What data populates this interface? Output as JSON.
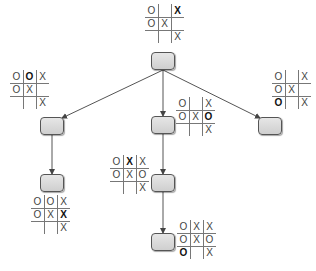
{
  "nodes": [
    {
      "id": "root",
      "x": 151,
      "y": 52,
      "board": {
        "x": 145,
        "y": 4,
        "cells": [
          [
            "O",
            "",
            "X"
          ],
          [
            "O",
            "X",
            ""
          ],
          [
            "",
            "",
            "X"
          ]
        ],
        "bold": [
          0,
          2
        ]
      }
    },
    {
      "id": "left-1",
      "x": 40,
      "y": 117,
      "board": {
        "x": 10,
        "y": 70,
        "cells": [
          [
            "O",
            "O",
            "X"
          ],
          [
            "O",
            "X",
            ""
          ],
          [
            "",
            "",
            "X"
          ]
        ],
        "bold": [
          0,
          1
        ]
      }
    },
    {
      "id": "mid-1",
      "x": 151,
      "y": 116,
      "board": {
        "x": 176,
        "y": 97,
        "cells": [
          [
            "O",
            "",
            "X"
          ],
          [
            "O",
            "X",
            "O"
          ],
          [
            "",
            "",
            "X"
          ]
        ],
        "bold": [
          1,
          2
        ]
      }
    },
    {
      "id": "right-1",
      "x": 258,
      "y": 117,
      "board": {
        "x": 272,
        "y": 70,
        "cells": [
          [
            "O",
            "",
            "X"
          ],
          [
            "O",
            "X",
            ""
          ],
          [
            "O",
            "",
            "X"
          ]
        ],
        "bold": [
          2,
          0
        ]
      }
    },
    {
      "id": "left-2",
      "x": 40,
      "y": 174,
      "board": {
        "x": 31,
        "y": 195,
        "cells": [
          [
            "O",
            "O",
            "X"
          ],
          [
            "O",
            "X",
            "X"
          ],
          [
            "",
            "",
            "X"
          ]
        ],
        "bold": [
          1,
          2
        ]
      }
    },
    {
      "id": "mid-2",
      "x": 151,
      "y": 174,
      "board": {
        "x": 110,
        "y": 155,
        "cells": [
          [
            "O",
            "X",
            "X"
          ],
          [
            "O",
            "X",
            "O"
          ],
          [
            "",
            "",
            "X"
          ]
        ],
        "bold": [
          0,
          1
        ]
      }
    },
    {
      "id": "mid-3",
      "x": 151,
      "y": 233,
      "board": {
        "x": 177,
        "y": 220,
        "cells": [
          [
            "O",
            "X",
            "X"
          ],
          [
            "O",
            "X",
            "O"
          ],
          [
            "O",
            "",
            "X"
          ]
        ],
        "bold": [
          2,
          0
        ]
      }
    }
  ],
  "edges": [
    [
      "root",
      "left-1"
    ],
    [
      "root",
      "mid-1"
    ],
    [
      "root",
      "right-1"
    ],
    [
      "left-1",
      "left-2"
    ],
    [
      "mid-1",
      "mid-2"
    ],
    [
      "mid-2",
      "mid-3"
    ]
  ],
  "colors": {
    "edge": "#555555",
    "node_border": "#555555",
    "node_fill": "#dcdcdc"
  }
}
